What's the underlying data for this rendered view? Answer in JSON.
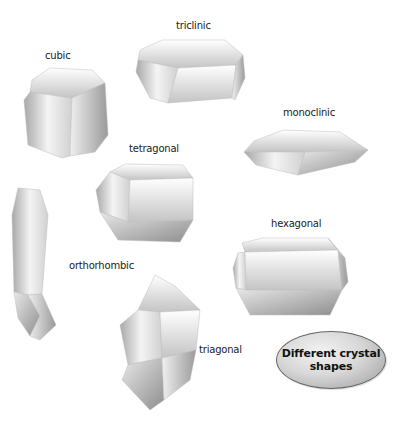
{
  "diagram": {
    "title": "Different crystal shapes",
    "title_line1": "Different crystal",
    "title_line2": "shapes",
    "crystals": [
      {
        "name": "cubic",
        "label": "cubic"
      },
      {
        "name": "triclinic",
        "label": "triclinic"
      },
      {
        "name": "monoclinic",
        "label": "monoclinic"
      },
      {
        "name": "tetragonal",
        "label": "tetragonal"
      },
      {
        "name": "orthorhombic",
        "label": "orthorhombic"
      },
      {
        "name": "hexagonal",
        "label": "hexagonal"
      },
      {
        "name": "triagonal",
        "label": "triagonal"
      }
    ],
    "colors": {
      "badge_fill": "#d0d0d0",
      "badge_border": "#666666",
      "crystal_light": "#ffffff",
      "crystal_dark": "#9a9a9a"
    }
  }
}
